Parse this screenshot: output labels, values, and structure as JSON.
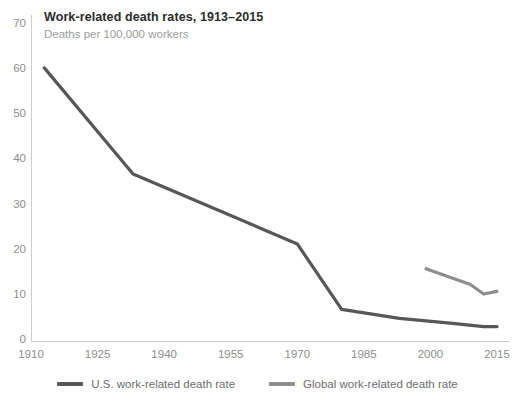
{
  "chart_data": {
    "type": "line",
    "title": "Work-related death rates, 1913–2015",
    "subtitle": "Deaths per 100,000 workers",
    "xlabel": "",
    "ylabel": "",
    "xlim": [
      1910,
      2015
    ],
    "ylim": [
      0,
      70
    ],
    "grid": false,
    "legend_position": "bottom",
    "xticks": [
      "1910",
      "1925",
      "1940",
      "1955",
      "1970",
      "1985",
      "2000",
      "2015"
    ],
    "xtick_values": [
      1910,
      1925,
      1940,
      1955,
      1970,
      1985,
      2000,
      2015
    ],
    "yticks": [
      "0",
      "10",
      "20",
      "30",
      "40",
      "50",
      "60",
      "70"
    ],
    "ytick_values": [
      0,
      10,
      20,
      30,
      40,
      50,
      60,
      70
    ],
    "series": [
      {
        "name": "U.S. work-related death rate",
        "color": "#575757",
        "x": [
          1913,
          1933,
          1970,
          1980,
          1993,
          2005,
          2012,
          2015
        ],
        "values": [
          60.5,
          37,
          21.5,
          7,
          5,
          3.9,
          3.2,
          3.2
        ]
      },
      {
        "name": "Global work-related death rate",
        "color": "#8d8d8d",
        "x": [
          1999,
          2009,
          2012,
          2015
        ],
        "values": [
          16,
          12.5,
          10.4,
          11
        ]
      }
    ],
    "legend": [
      {
        "label": "U.S. work-related death rate",
        "color": "#575757"
      },
      {
        "label": "Global work-related death rate",
        "color": "#8d8d8d"
      }
    ],
    "axis_color": "#cccccc"
  }
}
